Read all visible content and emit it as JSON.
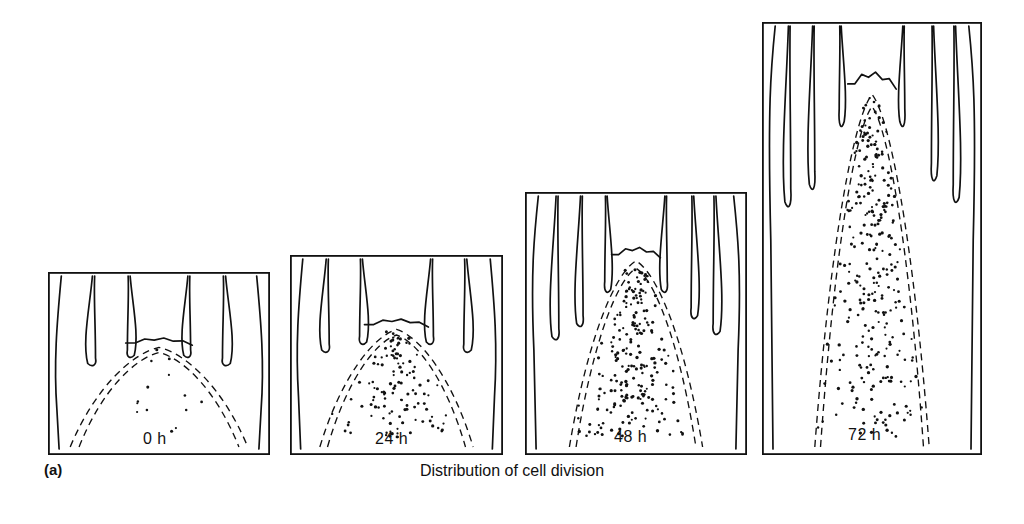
{
  "figure": {
    "panel_letter": "(a)",
    "caption": "Distribution of cell division",
    "background_color": "#ffffff",
    "ink_color": "#111111"
  },
  "panels": [
    {
      "id": "panel-0h",
      "time_label": "0 h",
      "hours": 0,
      "x": 48,
      "y": 272,
      "width": 222,
      "height": 183,
      "dot_count": 14,
      "label_x": 0.43,
      "label_y": 0.87
    },
    {
      "id": "panel-24h",
      "time_label": "24 h",
      "hours": 24,
      "x": 290,
      "y": 255,
      "width": 213,
      "height": 200,
      "dot_count": 118,
      "label_x": 0.4,
      "label_y": 0.88
    },
    {
      "id": "panel-48h",
      "time_label": "48 h",
      "hours": 48,
      "x": 525,
      "y": 192,
      "width": 222,
      "height": 263,
      "dot_count": 212,
      "label_x": 0.4,
      "label_y": 0.9
    },
    {
      "id": "panel-72h",
      "time_label": "72 h",
      "hours": 72,
      "x": 762,
      "y": 22,
      "width": 220,
      "height": 433,
      "dot_count": 290,
      "label_x": 0.39,
      "label_y": 0.935
    }
  ],
  "chart_data": {
    "type": "scatter",
    "title": "Distribution of cell division",
    "subtitle": "(a)",
    "xlabel": "",
    "ylabel": "",
    "legend": [],
    "grid": false,
    "categories": [
      "0 h",
      "24 h",
      "48 h",
      "72 h"
    ],
    "series": [
      {
        "name": "Labelled nuclei (cell division sites)",
        "values": [
          14,
          118,
          212,
          290
        ]
      }
    ],
    "annotations": [
      "Longitudinal sections of shoot apical meristem",
      "Dashed double lines outline the meristem / rib-zone boundary",
      "Dots mark sites of cell division; density increases with time"
    ]
  }
}
